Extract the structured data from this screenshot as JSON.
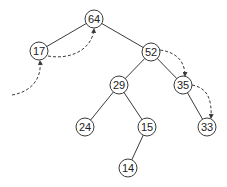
{
  "diagram": {
    "type": "binary-tree-with-threads",
    "node_radius": 9,
    "nodes": [
      {
        "id": "n64",
        "label": "64",
        "x": 94,
        "y": 19
      },
      {
        "id": "n17",
        "label": "17",
        "x": 39,
        "y": 51
      },
      {
        "id": "n52",
        "label": "52",
        "x": 151,
        "y": 52
      },
      {
        "id": "n29",
        "label": "29",
        "x": 119,
        "y": 85
      },
      {
        "id": "n35",
        "label": "35",
        "x": 183,
        "y": 85
      },
      {
        "id": "n24",
        "label": "24",
        "x": 85,
        "y": 127
      },
      {
        "id": "n15",
        "label": "15",
        "x": 147,
        "y": 127
      },
      {
        "id": "n33",
        "label": "33",
        "x": 207,
        "y": 127
      },
      {
        "id": "n14",
        "label": "14",
        "x": 128,
        "y": 168
      }
    ],
    "edges": [
      {
        "from": "64",
        "to": "17"
      },
      {
        "from": "64",
        "to": "52"
      },
      {
        "from": "52",
        "to": "29"
      },
      {
        "from": "52",
        "to": "35"
      },
      {
        "from": "29",
        "to": "24"
      },
      {
        "from": "29",
        "to": "15"
      },
      {
        "from": "15",
        "to": "14"
      },
      {
        "from": "35",
        "to": "33"
      }
    ],
    "dashed_arrows": [
      {
        "from": "entry",
        "to": "17"
      },
      {
        "from": "17",
        "to": "64"
      },
      {
        "from": "52",
        "to": "35"
      },
      {
        "from": "35",
        "to": "33"
      }
    ]
  }
}
